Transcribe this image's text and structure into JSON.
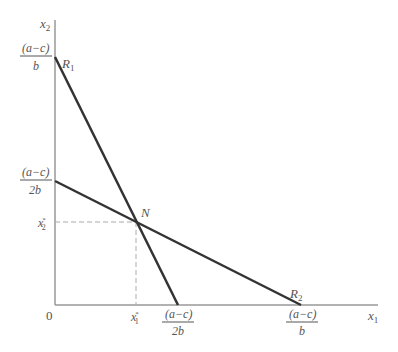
{
  "diagram": {
    "type": "reaction-functions",
    "axes": {
      "x_label": "x",
      "x_sub": "1",
      "y_label": "x",
      "y_sub": "2",
      "origin_label": "0"
    },
    "lines": [
      {
        "name": "R",
        "sub": "1",
        "from": "(a-c)/b on x2 axis",
        "to": "(a-c)/2b on x1 axis"
      },
      {
        "name": "R",
        "sub": "2",
        "from": "(a-c)/2b on x2 axis",
        "to": "(a-c)/b on x1 axis"
      }
    ],
    "intersection": {
      "label": "N"
    },
    "y_ticks": [
      {
        "num": "(a−c)",
        "den": "b"
      },
      {
        "num": "(a−c)",
        "den": "2b"
      },
      {
        "label": "x",
        "sub": "2",
        "sup": "*"
      }
    ],
    "x_ticks": [
      {
        "label": "x",
        "sub": "1",
        "sup": "*"
      },
      {
        "num": "(a−c)",
        "den": "2b"
      },
      {
        "num": "(a−c)",
        "den": "b"
      }
    ],
    "colors": {
      "axis": "#999999",
      "line": "#333333",
      "dash": "#aaaaaa",
      "text": "#555555"
    }
  }
}
